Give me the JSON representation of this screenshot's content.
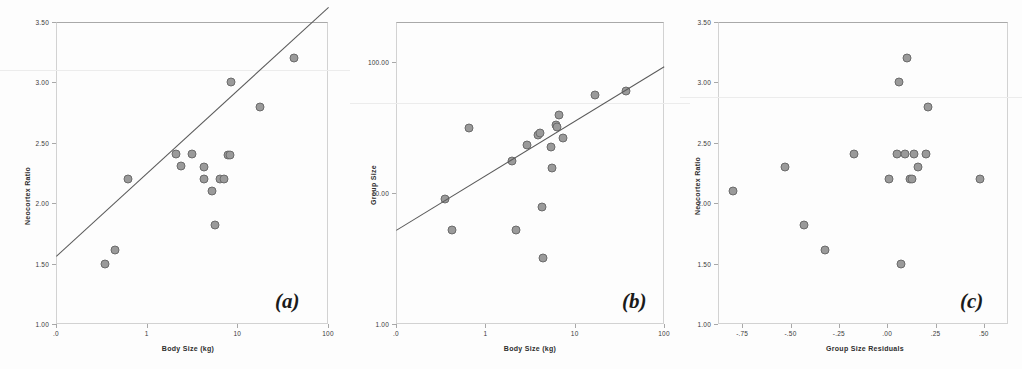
{
  "figure": {
    "background": "#fdfdfd",
    "marker_fill": "#9a9a9a",
    "marker_stroke": "#6b6b6b",
    "line_color": "#5a5a5a",
    "frame_color": "#c9c9c9"
  },
  "panels": [
    {
      "tag": "(a)",
      "xlabel": "Body Size (kg)",
      "ylabel": "Neocortex Ratio",
      "xticks": [
        ".0",
        "1",
        "10",
        "100"
      ],
      "yticks": [
        "1.00",
        "1.50",
        "2.00",
        "2.50",
        "3.00",
        "3.50"
      ]
    },
    {
      "tag": "(b)",
      "xlabel": "Body Size (kg)",
      "ylabel": "Group Size",
      "xticks": [
        ".0",
        "1",
        "10",
        "100"
      ],
      "yticks": [
        "1.00",
        "10.00",
        "100.00"
      ]
    },
    {
      "tag": "(c)",
      "xlabel": "Group Size Residuals",
      "ylabel": "Neocortex Ratio",
      "xticks": [
        "-.75",
        "-.50",
        "-.25",
        ".00",
        ".25",
        ".50"
      ],
      "yticks": [
        "1.00",
        "1.50",
        "2.00",
        "2.50",
        "3.00",
        "3.50"
      ]
    }
  ],
  "chart_data": [
    {
      "type": "scatter",
      "panel": "(a)",
      "title": "",
      "xlabel": "Body Size (kg)",
      "ylabel": "Neocortex Ratio",
      "xscale": "log",
      "yscale": "linear",
      "xlim": [
        0.1,
        100
      ],
      "ylim": [
        1.0,
        3.5
      ],
      "xticks": [
        0.1,
        1,
        10,
        100
      ],
      "xtick_labels": [
        ".0",
        "1",
        "10",
        "100"
      ],
      "yticks": [
        1.0,
        1.5,
        2.0,
        2.5,
        3.0,
        3.5
      ],
      "ytick_labels": [
        "1.00",
        "1.50",
        "2.00",
        "2.50",
        "3.00",
        "3.50"
      ],
      "grid": false,
      "legend": "none",
      "points": [
        {
          "x": 0.35,
          "y": 1.5
        },
        {
          "x": 0.45,
          "y": 1.61
        },
        {
          "x": 0.62,
          "y": 2.2
        },
        {
          "x": 2.1,
          "y": 2.41
        },
        {
          "x": 2.4,
          "y": 2.31
        },
        {
          "x": 3.2,
          "y": 2.41
        },
        {
          "x": 4.3,
          "y": 2.3
        },
        {
          "x": 4.3,
          "y": 2.2
        },
        {
          "x": 5.2,
          "y": 2.1
        },
        {
          "x": 5.6,
          "y": 1.82
        },
        {
          "x": 6.5,
          "y": 2.2
        },
        {
          "x": 7.1,
          "y": 2.2
        },
        {
          "x": 7.8,
          "y": 2.4
        },
        {
          "x": 8.4,
          "y": 2.4
        },
        {
          "x": 8.6,
          "y": 3.0
        },
        {
          "x": 18.0,
          "y": 2.8
        },
        {
          "x": 42.0,
          "y": 3.2
        }
      ],
      "regression_line": {
        "x_start": 0.1,
        "y_start": 1.56,
        "x_end": 100,
        "y_end": 3.62
      }
    },
    {
      "type": "scatter",
      "panel": "(b)",
      "title": "",
      "xlabel": "Body Size (kg)",
      "ylabel": "Group Size",
      "xscale": "log",
      "yscale": "log",
      "xlim": [
        0.1,
        100
      ],
      "ylim": [
        1.0,
        200
      ],
      "xticks": [
        0.1,
        1,
        10,
        100
      ],
      "xtick_labels": [
        ".0",
        "1",
        "10",
        "100"
      ],
      "yticks": [
        1,
        10,
        100
      ],
      "ytick_labels": [
        "1.00",
        "10.00",
        "100.00"
      ],
      "grid": false,
      "legend": "none",
      "points": [
        {
          "x": 0.35,
          "y": 9.0
        },
        {
          "x": 0.42,
          "y": 5.2
        },
        {
          "x": 0.66,
          "y": 31.0
        },
        {
          "x": 2.0,
          "y": 17.5
        },
        {
          "x": 2.2,
          "y": 5.2
        },
        {
          "x": 2.9,
          "y": 23.0
        },
        {
          "x": 3.9,
          "y": 27.5
        },
        {
          "x": 4.1,
          "y": 28.5
        },
        {
          "x": 4.3,
          "y": 7.8
        },
        {
          "x": 4.4,
          "y": 3.2
        },
        {
          "x": 5.4,
          "y": 22.5
        },
        {
          "x": 5.6,
          "y": 15.5
        },
        {
          "x": 6.2,
          "y": 33.0
        },
        {
          "x": 6.4,
          "y": 31.5
        },
        {
          "x": 6.6,
          "y": 39.0
        },
        {
          "x": 7.4,
          "y": 26.0
        },
        {
          "x": 17.0,
          "y": 56.0
        },
        {
          "x": 38.0,
          "y": 60.0
        }
      ],
      "regression_line": {
        "x_start": 0.1,
        "y_start": 5.2,
        "x_end": 100,
        "y_end": 92.0
      }
    },
    {
      "type": "scatter",
      "panel": "(c)",
      "title": "",
      "xlabel": "Group Size Residuals",
      "ylabel": "Neocortex Ratio",
      "xscale": "linear",
      "yscale": "linear",
      "xlim": [
        -0.875,
        0.625
      ],
      "ylim": [
        1.0,
        3.5
      ],
      "xticks": [
        -0.75,
        -0.5,
        -0.25,
        0.0,
        0.25,
        0.5
      ],
      "xtick_labels": [
        "-.75",
        "-.50",
        "-.25",
        ".00",
        ".25",
        ".50"
      ],
      "yticks": [
        1.0,
        1.5,
        2.0,
        2.5,
        3.0,
        3.5
      ],
      "ytick_labels": [
        "1.00",
        "1.50",
        "2.00",
        "2.50",
        "3.00",
        "3.50"
      ],
      "grid": false,
      "legend": "none",
      "points": [
        {
          "x": -0.8,
          "y": 2.1
        },
        {
          "x": -0.53,
          "y": 2.3
        },
        {
          "x": -0.43,
          "y": 1.82
        },
        {
          "x": -0.32,
          "y": 1.61
        },
        {
          "x": -0.17,
          "y": 2.41
        },
        {
          "x": 0.01,
          "y": 2.2
        },
        {
          "x": 0.05,
          "y": 2.41
        },
        {
          "x": 0.06,
          "y": 3.0
        },
        {
          "x": 0.07,
          "y": 1.5
        },
        {
          "x": 0.09,
          "y": 2.41
        },
        {
          "x": 0.1,
          "y": 3.2
        },
        {
          "x": 0.12,
          "y": 2.2
        },
        {
          "x": 0.13,
          "y": 2.2
        },
        {
          "x": 0.14,
          "y": 2.41
        },
        {
          "x": 0.16,
          "y": 2.3
        },
        {
          "x": 0.2,
          "y": 2.41
        },
        {
          "x": 0.21,
          "y": 2.8
        },
        {
          "x": 0.48,
          "y": 2.2
        }
      ],
      "regression_line": null
    }
  ]
}
